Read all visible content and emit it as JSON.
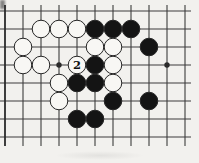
{
  "diagram": {
    "type": "go-board-diagram",
    "board": {
      "cols": 11,
      "rows": 8,
      "origin": {
        "x": 5,
        "y": 11
      },
      "cell": 18,
      "stubs": {
        "left": 5,
        "right": 6,
        "top": 6,
        "bottom": 9
      },
      "star_points": [
        {
          "col": 3,
          "row": 3
        },
        {
          "col": 9,
          "row": 3
        }
      ],
      "stones": [
        {
          "col": 2,
          "row": 1,
          "color": "white"
        },
        {
          "col": 3,
          "row": 1,
          "color": "white"
        },
        {
          "col": 4,
          "row": 1,
          "color": "white"
        },
        {
          "col": 5,
          "row": 1,
          "color": "black"
        },
        {
          "col": 6,
          "row": 1,
          "color": "black"
        },
        {
          "col": 7,
          "row": 1,
          "color": "black"
        },
        {
          "col": 1,
          "row": 2,
          "color": "white"
        },
        {
          "col": 5,
          "row": 2,
          "color": "white"
        },
        {
          "col": 6,
          "row": 2,
          "color": "white"
        },
        {
          "col": 8,
          "row": 2,
          "color": "black"
        },
        {
          "col": 1,
          "row": 3,
          "color": "white"
        },
        {
          "col": 2,
          "row": 3,
          "color": "white"
        },
        {
          "col": 4,
          "row": 3,
          "color": "white",
          "label": "2"
        },
        {
          "col": 5,
          "row": 3,
          "color": "black"
        },
        {
          "col": 6,
          "row": 3,
          "color": "white"
        },
        {
          "col": 3,
          "row": 4,
          "color": "white"
        },
        {
          "col": 4,
          "row": 4,
          "color": "black"
        },
        {
          "col": 5,
          "row": 4,
          "color": "black"
        },
        {
          "col": 6,
          "row": 4,
          "color": "white"
        },
        {
          "col": 3,
          "row": 5,
          "color": "white"
        },
        {
          "col": 6,
          "row": 5,
          "color": "black"
        },
        {
          "col": 8,
          "row": 5,
          "color": "black"
        },
        {
          "col": 4,
          "row": 6,
          "color": "black"
        },
        {
          "col": 5,
          "row": 6,
          "color": "black"
        }
      ]
    },
    "stone_diameter": 17.6,
    "star_point_radius": 2.7,
    "label_font_size": 11.5,
    "colors": {
      "paper": "#f2f1ee",
      "line": "#3c3c3c",
      "edge_line": "#2a2a2a",
      "black_stone": "#141414",
      "white_stone": "#f8f7f4",
      "stone_outline": "#262626",
      "label_text": "#111111"
    }
  }
}
